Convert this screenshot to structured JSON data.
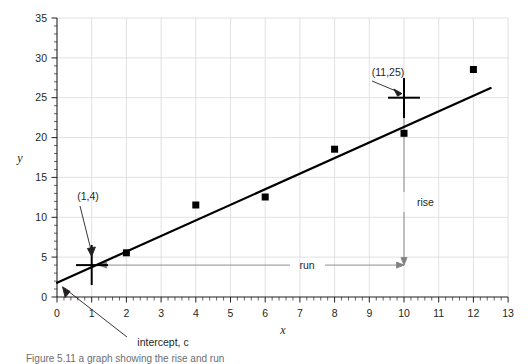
{
  "figure": {
    "caption": "Figure 5.11   a graph showing the rise and run",
    "background_color": "#ffffff"
  },
  "chart_data": {
    "type": "scatter",
    "title": "",
    "subtitle": "",
    "xlabel": "x",
    "ylabel": "y",
    "xlim": [
      0,
      13
    ],
    "ylim": [
      0,
      35
    ],
    "x_major_step": 1,
    "y_major_step": 5,
    "x_minor_step": 0.2,
    "y_minor_step": 1,
    "grid": true,
    "grid_color": "#d9d9d9",
    "legend": "none",
    "marker": "square",
    "marker_color": "#000000",
    "line_color": "#000000",
    "xticklabels": [
      "0",
      "1",
      "2",
      "3",
      "4",
      "5",
      "6",
      "7",
      "8",
      "9",
      "10",
      "11",
      "12",
      "13"
    ],
    "yticklabels": [
      "0",
      "5",
      "10",
      "15",
      "20",
      "25",
      "30",
      "35"
    ],
    "points": [
      {
        "x": 2,
        "y": 6
      },
      {
        "x": 4,
        "y": 12
      },
      {
        "x": 6,
        "y": 13
      },
      {
        "x": 8,
        "y": 19
      },
      {
        "x": 10,
        "y": 21
      },
      {
        "x": 12,
        "y": 29
      }
    ],
    "trendline": {
      "x0": 0,
      "y0": 1.8,
      "x1": 12.5,
      "y1": 26.2
    },
    "markers_crosshair": [
      {
        "x": 1,
        "y": 4,
        "label": "(1,4)"
      },
      {
        "x": 11,
        "y": 25,
        "label": "(11,25)"
      }
    ],
    "annotations": [
      {
        "name": "point-label-1-4",
        "text": "(1,4)"
      },
      {
        "name": "point-label-11-25",
        "text": "(11,25)"
      },
      {
        "name": "intercept-label",
        "text": "intercept, c"
      },
      {
        "name": "rise-label",
        "text": "rise"
      },
      {
        "name": "run-label",
        "text": "run"
      }
    ],
    "rise": {
      "from_y": 25,
      "to_y": 4,
      "at_x": 11,
      "label": "rise"
    },
    "run": {
      "from_x": 1,
      "to_x": 11,
      "at_y": 4,
      "label": "run"
    }
  },
  "labels": {
    "x_axis_title": "x",
    "y_axis_title": "y",
    "point_a": "(1,4)",
    "point_b": "(11,25)",
    "intercept": "intercept, c",
    "rise": "rise",
    "run": "run"
  }
}
